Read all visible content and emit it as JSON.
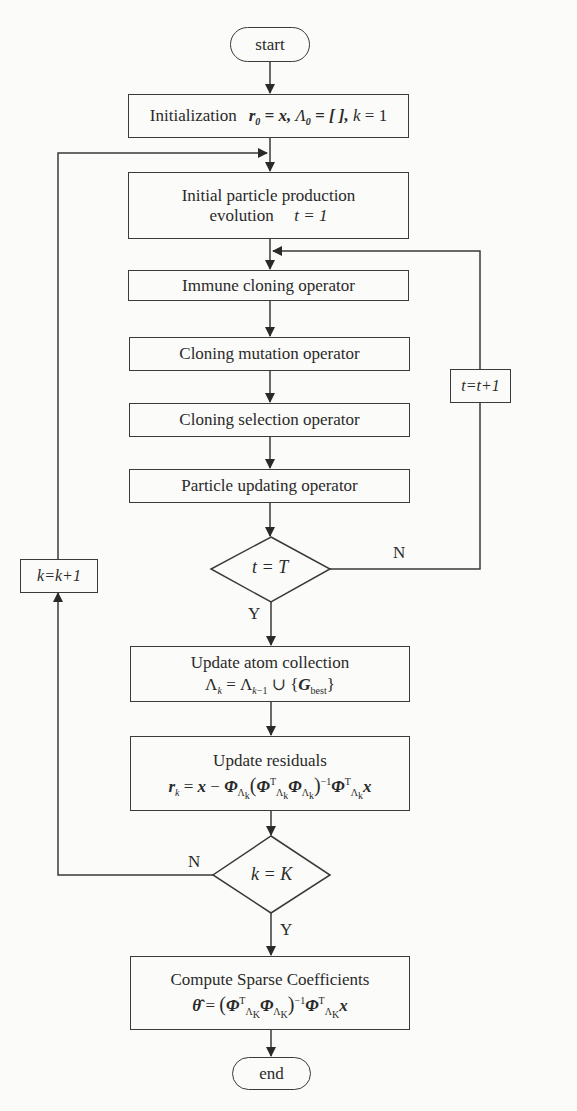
{
  "flowchart": {
    "start": {
      "label": "start"
    },
    "init": {
      "label": "Initialization",
      "formula": "r₀ = x, Λ₀ = [ ], k = 1"
    },
    "initial_particle": {
      "line1": "Initial particle production",
      "line2_text": "evolution",
      "line2_formula": "t = 1"
    },
    "immune_cloning": {
      "label": "Immune cloning operator"
    },
    "cloning_mutation": {
      "label": "Cloning mutation operator"
    },
    "cloning_selection": {
      "label": "Cloning selection operator"
    },
    "particle_updating": {
      "label": "Particle updating operator"
    },
    "decision_t": {
      "label": "t = T",
      "no": "N",
      "yes": "Y"
    },
    "t_increment": {
      "label": "t=t+1"
    },
    "update_atom": {
      "line1": "Update atom collection",
      "formula": "Λₖ = Λₖ₋₁ ∪ {G_best}"
    },
    "update_residuals": {
      "line1": "Update residuals",
      "formula": "rₖ = x − Φ_Λₖ (Φᵀ_Λₖ Φ_Λₖ)⁻¹ Φᵀ_Λₖ x"
    },
    "decision_k": {
      "label": "k = K",
      "no": "N",
      "yes": "Y"
    },
    "k_increment": {
      "label": "k=k+1"
    },
    "compute": {
      "line1": "Compute Sparse Coefficients",
      "formula": "θ̂ = (Φᵀ_ΛK Φ_ΛK)⁻¹ Φᵀ_ΛK x"
    },
    "end": {
      "label": "end"
    }
  },
  "colors": {
    "stroke": "#3a3a3a",
    "background": "#fbfbf9",
    "text": "#2a2a2a"
  }
}
